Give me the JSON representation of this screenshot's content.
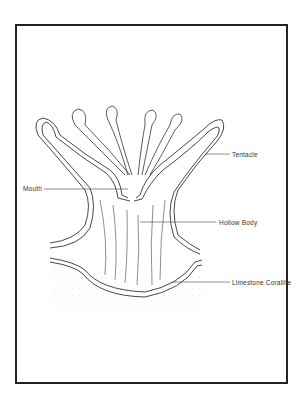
{
  "diagram": {
    "labels": {
      "tentacle": "Tentacle",
      "mouth": "Mouth",
      "hollow_body": "Hollow Body",
      "limestone_corallite": "Limestone Corallite"
    },
    "colors": {
      "line": "#333333",
      "frame": "#222222",
      "stipple": "#bbbbbb"
    }
  }
}
